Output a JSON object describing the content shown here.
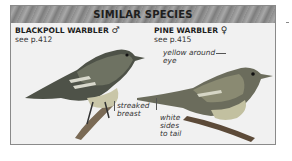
{
  "header": {
    "title": "SIMILAR SPECIES"
  },
  "species": [
    {
      "name": "BLACKPOLL WARBLER",
      "sex_symbol": "♂",
      "page_ref": "see p.412",
      "labels": [
        {
          "text_lines": [
            "streaked",
            "breast"
          ]
        }
      ]
    },
    {
      "name": "PINE WARBLER",
      "sex_symbol": "♀",
      "page_ref": "see p.415",
      "labels": [
        {
          "text_lines": [
            "yellow around",
            "eye"
          ]
        },
        {
          "text_lines": [
            "white",
            "sides",
            "to tail"
          ]
        }
      ]
    }
  ],
  "colors": {
    "panel_bg": "#f1f1f1",
    "header_bg": "#969696",
    "border": "#8a8a8a",
    "text": "#1e1e1e"
  }
}
